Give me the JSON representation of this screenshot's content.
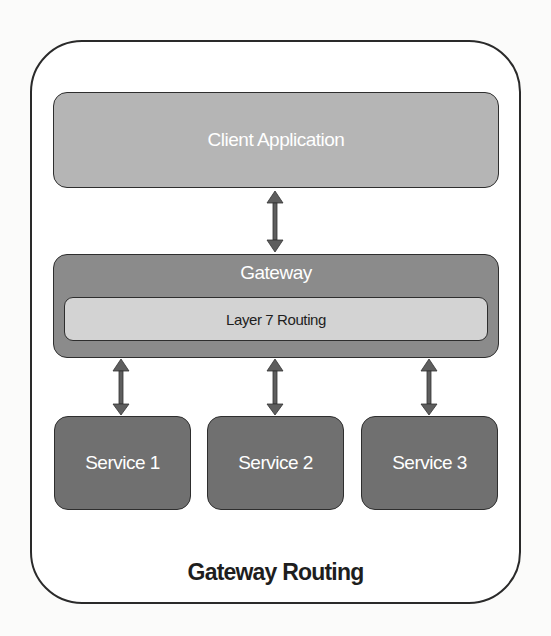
{
  "diagram": {
    "title": "Gateway Routing",
    "client": {
      "label": "Client Application"
    },
    "gateway": {
      "label": "Gateway",
      "inner": {
        "label": "Layer 7 Routing"
      }
    },
    "services": [
      {
        "label": "Service 1"
      },
      {
        "label": "Service 2"
      },
      {
        "label": "Service 3"
      }
    ],
    "connections": [
      {
        "from": "Client Application",
        "to": "Gateway",
        "type": "bidirectional"
      },
      {
        "from": "Gateway",
        "to": "Service 1",
        "type": "bidirectional"
      },
      {
        "from": "Gateway",
        "to": "Service 2",
        "type": "bidirectional"
      },
      {
        "from": "Gateway",
        "to": "Service 3",
        "type": "bidirectional"
      }
    ],
    "colors": {
      "client_fill": "#b5b5b5",
      "gateway_fill": "#8b8b8b",
      "routing_fill": "#d3d3d3",
      "service_fill": "#707070",
      "arrow": "#5e5e5e",
      "border": "#2e2e2e"
    }
  }
}
